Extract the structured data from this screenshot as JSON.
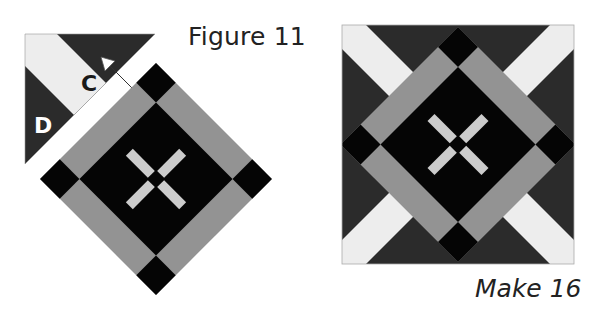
{
  "figure": {
    "title": "Figure 11",
    "caption": "Make 16",
    "labels": {
      "c": "C",
      "d": "D"
    }
  },
  "colors": {
    "dark": "#2b2b2b",
    "black": "#050505",
    "gray": "#939393",
    "light": "#cccccc",
    "cream": "#ededed",
    "white": "#ffffff"
  }
}
